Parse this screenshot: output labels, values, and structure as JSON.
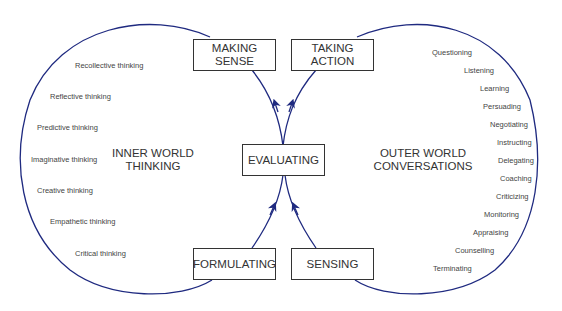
{
  "colors": {
    "curve": "#1f2a80",
    "box_border": "#333333",
    "text": "#333333"
  },
  "boxes": {
    "making_sense": "MAKING\nSENSE",
    "taking_action": "TAKING\nACTION",
    "evaluating": "EVALUATING",
    "formulating": "FORMULATING",
    "sensing": "SENSING"
  },
  "zones": {
    "inner": "INNER WORLD\nTHINKING",
    "outer": "OUTER WORLD\nCONVERSATIONS"
  },
  "inner_items": [
    "Recollective thinking",
    "Reflective thinking",
    "Predictive thinking",
    "Imaginative thinking",
    "Creative thinking",
    "Empathetic thinking",
    "Critical thinking"
  ],
  "outer_items": [
    "Questioning",
    "Listening",
    "Learning",
    "Persuading",
    "Negotiating",
    "Instructing",
    "Delegating",
    "Coaching",
    "Criticizing",
    "Monitoring",
    "Appraising",
    "Counselling",
    "Terminating"
  ]
}
